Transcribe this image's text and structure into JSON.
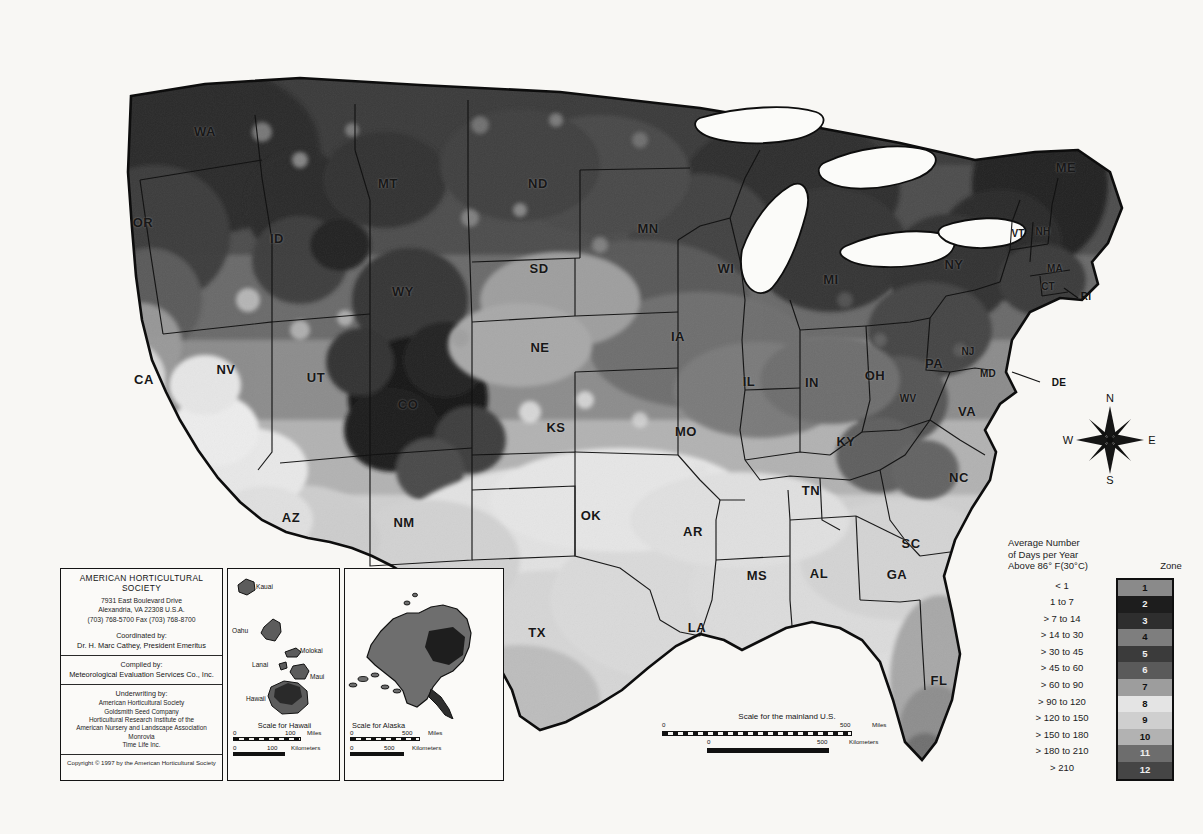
{
  "document": {
    "type": "map",
    "subject": "AHS Plant Heat-Zone Map of the United States"
  },
  "legend": {
    "title": "Average Number\nof Days per Year\nAbove 86° F(30°C)",
    "zone_header": "Zone",
    "rows": [
      {
        "zone": "1",
        "label": "< 1",
        "color": "#8a8a8a"
      },
      {
        "zone": "2",
        "label": "1 to 7",
        "color": "#1d1d1d"
      },
      {
        "zone": "3",
        "label": "> 7 to 14",
        "color": "#2e2e2e"
      },
      {
        "zone": "4",
        "label": "> 14 to 30",
        "color": "#7e7e7e"
      },
      {
        "zone": "5",
        "label": "> 30 to 45",
        "color": "#3b3b3b"
      },
      {
        "zone": "6",
        "label": "> 45 to 60",
        "color": "#5a5a5a"
      },
      {
        "zone": "7",
        "label": "> 60 to 90",
        "color": "#9d9d9d"
      },
      {
        "zone": "8",
        "label": "> 90 to 120",
        "color": "#e4e4e4"
      },
      {
        "zone": "9",
        "label": "> 120 to 150",
        "color": "#cfcfcf"
      },
      {
        "zone": "10",
        "label": "> 150 to 180",
        "color": "#b2b2b2"
      },
      {
        "zone": "11",
        "label": "> 180 to 210",
        "color": "#6d6d6d"
      },
      {
        "zone": "12",
        "label": "> 210",
        "color": "#454545"
      }
    ]
  },
  "compass": {
    "north": "N",
    "south": "S",
    "east": "E",
    "west": "W"
  },
  "credits": {
    "organization": "AMERICAN HORTICULTURAL SOCIETY",
    "address_line1": "7931 East Boulevard Drive",
    "address_line2": "Alexandria, VA 22308 U.S.A.",
    "phone_line": "(703) 768-5700 Fax (703) 768-8700",
    "coordinated_lead": "Coordinated by:",
    "coordinated_name": "Dr. H. Marc Cathey, President Emeritus",
    "compiled_lead": "Compiled by:",
    "compiled_name": "Meteorological Evaluation Services Co., Inc.",
    "underwriting_lead": "Underwriting by:",
    "underwriters": [
      "American Horticultural Society",
      "Goldsmith Seed Company",
      "Horticultural Research Institute of the",
      "American Nursery and Landscape Association",
      "Monrovia",
      "Time Life Inc."
    ],
    "copyright": "Copyright © 1997 by the American Horticultural Society"
  },
  "insets": {
    "hawaii": {
      "scale_title": "Scale for Hawaii",
      "miles": {
        "start": "0",
        "end": "100",
        "unit": "Miles"
      },
      "kilometers": {
        "start": "0",
        "end": "100",
        "unit": "Kilometers"
      },
      "islands": [
        {
          "name": "Kauai"
        },
        {
          "name": "Oahu"
        },
        {
          "name": "Molokai"
        },
        {
          "name": "Lanai"
        },
        {
          "name": "Maui"
        },
        {
          "name": "Hawaii"
        }
      ]
    },
    "alaska": {
      "scale_title": "Scale for Alaska",
      "miles": {
        "start": "0",
        "end": "500",
        "unit": "Miles"
      },
      "kilometers": {
        "start": "0",
        "end": "500",
        "unit": "Kilometers"
      }
    }
  },
  "mainland_scale": {
    "title": "Scale for the mainland U.S.",
    "miles": {
      "start": "0",
      "end": "500",
      "unit": "Miles"
    },
    "kilometers": {
      "start": "0",
      "end": "500",
      "unit": "Kilometers"
    }
  },
  "states": [
    {
      "code": "WA",
      "x": 205,
      "y": 131
    },
    {
      "code": "OR",
      "x": 143,
      "y": 222
    },
    {
      "code": "MT",
      "x": 388,
      "y": 183
    },
    {
      "code": "ID",
      "x": 277,
      "y": 238
    },
    {
      "code": "ND",
      "x": 538,
      "y": 183
    },
    {
      "code": "MN",
      "x": 648,
      "y": 228
    },
    {
      "code": "SD",
      "x": 539,
      "y": 268
    },
    {
      "code": "WI",
      "x": 726,
      "y": 268
    },
    {
      "code": "MI",
      "x": 831,
      "y": 279
    },
    {
      "code": "WY",
      "x": 403,
      "y": 291
    },
    {
      "code": "IA",
      "x": 678,
      "y": 336
    },
    {
      "code": "NE",
      "x": 540,
      "y": 347
    },
    {
      "code": "NV",
      "x": 226,
      "y": 369
    },
    {
      "code": "UT",
      "x": 316,
      "y": 377
    },
    {
      "code": "CA",
      "x": 144,
      "y": 379
    },
    {
      "code": "IL",
      "x": 749,
      "y": 381
    },
    {
      "code": "IN",
      "x": 812,
      "y": 382
    },
    {
      "code": "OH",
      "x": 875,
      "y": 375
    },
    {
      "code": "PA",
      "x": 934,
      "y": 363
    },
    {
      "code": "NY",
      "x": 954,
      "y": 264
    },
    {
      "code": "ME",
      "x": 1066,
      "y": 167
    },
    {
      "code": "VT",
      "x": 1018,
      "y": 233
    },
    {
      "code": "NH",
      "x": 1043,
      "y": 231
    },
    {
      "code": "MA",
      "x": 1055,
      "y": 268
    },
    {
      "code": "CT",
      "x": 1048,
      "y": 286
    },
    {
      "code": "RI",
      "x": 1086,
      "y": 296
    },
    {
      "code": "NJ",
      "x": 968,
      "y": 351
    },
    {
      "code": "MD",
      "x": 988,
      "y": 373
    },
    {
      "code": "DE",
      "x": 1059,
      "y": 382
    },
    {
      "code": "CO",
      "x": 408,
      "y": 404
    },
    {
      "code": "WV",
      "x": 908,
      "y": 398
    },
    {
      "code": "VA",
      "x": 967,
      "y": 411
    },
    {
      "code": "KS",
      "x": 556,
      "y": 427
    },
    {
      "code": "MO",
      "x": 686,
      "y": 431
    },
    {
      "code": "KY",
      "x": 846,
      "y": 441
    },
    {
      "code": "NC",
      "x": 959,
      "y": 477
    },
    {
      "code": "TN",
      "x": 811,
      "y": 490
    },
    {
      "code": "AZ",
      "x": 291,
      "y": 517
    },
    {
      "code": "NM",
      "x": 404,
      "y": 522
    },
    {
      "code": "OK",
      "x": 591,
      "y": 515
    },
    {
      "code": "AR",
      "x": 693,
      "y": 531
    },
    {
      "code": "SC",
      "x": 911,
      "y": 543
    },
    {
      "code": "MS",
      "x": 757,
      "y": 575
    },
    {
      "code": "AL",
      "x": 819,
      "y": 573
    },
    {
      "code": "GA",
      "x": 897,
      "y": 574
    },
    {
      "code": "TX",
      "x": 537,
      "y": 632
    },
    {
      "code": "LA",
      "x": 697,
      "y": 627
    },
    {
      "code": "FL",
      "x": 939,
      "y": 680
    }
  ]
}
